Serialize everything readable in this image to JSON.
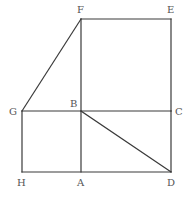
{
  "diagram": {
    "stroke_color": "#3a3a3a",
    "label_color": "#555555",
    "points": {
      "F": {
        "x": 81,
        "y": 19
      },
      "E": {
        "x": 171,
        "y": 19
      },
      "G": {
        "x": 22,
        "y": 111
      },
      "B": {
        "x": 81,
        "y": 111
      },
      "C": {
        "x": 171,
        "y": 111
      },
      "H": {
        "x": 22,
        "y": 172
      },
      "A": {
        "x": 81,
        "y": 172
      },
      "D": {
        "x": 171,
        "y": 172
      }
    },
    "labels": {
      "F": "F",
      "E": "E",
      "G": "G",
      "B": "B",
      "C": "C",
      "H": "H",
      "A": "A",
      "D": "D"
    },
    "segments": [
      [
        "F",
        "E"
      ],
      [
        "E",
        "C"
      ],
      [
        "C",
        "D"
      ],
      [
        "F",
        "B"
      ],
      [
        "B",
        "A"
      ],
      [
        "G",
        "C"
      ],
      [
        "H",
        "D"
      ],
      [
        "G",
        "H"
      ],
      [
        "F",
        "G"
      ],
      [
        "B",
        "D"
      ]
    ]
  }
}
